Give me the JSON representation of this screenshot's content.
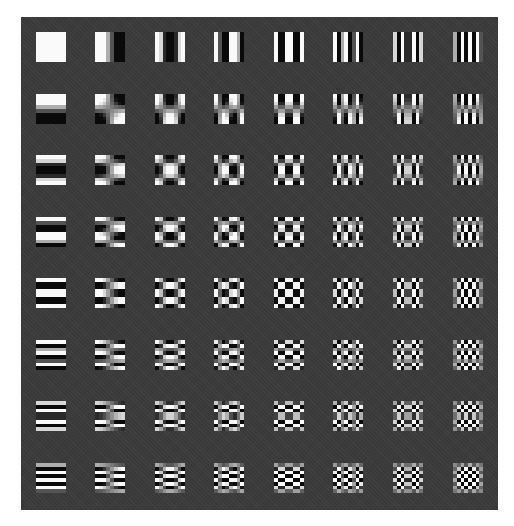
{
  "figure": {
    "title": "",
    "grid": {
      "rows": 8,
      "cols": 8
    },
    "panel_color": "#3b3b3b",
    "cell_size_px": 30,
    "col_x": [
      36,
      95,
      155,
      214,
      274,
      333,
      393,
      453
    ],
    "row_y": [
      32,
      94,
      155,
      217,
      278,
      340,
      401,
      463
    ],
    "basis": "cos((2x+1)u*pi/16) * cos((2y+1)v*pi/16)",
    "cells": [
      {
        "row": 0,
        "col": 0,
        "u": 0,
        "v": 0
      },
      {
        "row": 0,
        "col": 1,
        "u": 1,
        "v": 0
      },
      {
        "row": 0,
        "col": 2,
        "u": 2,
        "v": 0
      },
      {
        "row": 0,
        "col": 3,
        "u": 3,
        "v": 0
      },
      {
        "row": 0,
        "col": 4,
        "u": 4,
        "v": 0
      },
      {
        "row": 0,
        "col": 5,
        "u": 5,
        "v": 0
      },
      {
        "row": 0,
        "col": 6,
        "u": 6,
        "v": 0
      },
      {
        "row": 0,
        "col": 7,
        "u": 7,
        "v": 0
      },
      {
        "row": 1,
        "col": 0,
        "u": 0,
        "v": 1
      },
      {
        "row": 1,
        "col": 1,
        "u": 1,
        "v": 1
      },
      {
        "row": 1,
        "col": 2,
        "u": 2,
        "v": 1
      },
      {
        "row": 1,
        "col": 3,
        "u": 3,
        "v": 1
      },
      {
        "row": 1,
        "col": 4,
        "u": 4,
        "v": 1
      },
      {
        "row": 1,
        "col": 5,
        "u": 5,
        "v": 1
      },
      {
        "row": 1,
        "col": 6,
        "u": 6,
        "v": 1
      },
      {
        "row": 1,
        "col": 7,
        "u": 7,
        "v": 1
      },
      {
        "row": 2,
        "col": 0,
        "u": 0,
        "v": 2
      },
      {
        "row": 2,
        "col": 1,
        "u": 1,
        "v": 2
      },
      {
        "row": 2,
        "col": 2,
        "u": 2,
        "v": 2
      },
      {
        "row": 2,
        "col": 3,
        "u": 3,
        "v": 2
      },
      {
        "row": 2,
        "col": 4,
        "u": 4,
        "v": 2
      },
      {
        "row": 2,
        "col": 5,
        "u": 5,
        "v": 2
      },
      {
        "row": 2,
        "col": 6,
        "u": 6,
        "v": 2
      },
      {
        "row": 2,
        "col": 7,
        "u": 7,
        "v": 2
      },
      {
        "row": 3,
        "col": 0,
        "u": 0,
        "v": 3
      },
      {
        "row": 3,
        "col": 1,
        "u": 1,
        "v": 3
      },
      {
        "row": 3,
        "col": 2,
        "u": 2,
        "v": 3
      },
      {
        "row": 3,
        "col": 3,
        "u": 3,
        "v": 3
      },
      {
        "row": 3,
        "col": 4,
        "u": 4,
        "v": 3
      },
      {
        "row": 3,
        "col": 5,
        "u": 5,
        "v": 3
      },
      {
        "row": 3,
        "col": 6,
        "u": 6,
        "v": 3
      },
      {
        "row": 3,
        "col": 7,
        "u": 7,
        "v": 3
      },
      {
        "row": 4,
        "col": 0,
        "u": 0,
        "v": 4
      },
      {
        "row": 4,
        "col": 1,
        "u": 1,
        "v": 4
      },
      {
        "row": 4,
        "col": 2,
        "u": 2,
        "v": 4
      },
      {
        "row": 4,
        "col": 3,
        "u": 3,
        "v": 4
      },
      {
        "row": 4,
        "col": 4,
        "u": 4,
        "v": 4
      },
      {
        "row": 4,
        "col": 5,
        "u": 5,
        "v": 4
      },
      {
        "row": 4,
        "col": 6,
        "u": 6,
        "v": 4
      },
      {
        "row": 4,
        "col": 7,
        "u": 7,
        "v": 4
      },
      {
        "row": 5,
        "col": 0,
        "u": 0,
        "v": 5
      },
      {
        "row": 5,
        "col": 1,
        "u": 1,
        "v": 5
      },
      {
        "row": 5,
        "col": 2,
        "u": 2,
        "v": 5
      },
      {
        "row": 5,
        "col": 3,
        "u": 3,
        "v": 5
      },
      {
        "row": 5,
        "col": 4,
        "u": 4,
        "v": 5
      },
      {
        "row": 5,
        "col": 5,
        "u": 5,
        "v": 5
      },
      {
        "row": 5,
        "col": 6,
        "u": 6,
        "v": 5
      },
      {
        "row": 5,
        "col": 7,
        "u": 7,
        "v": 5
      },
      {
        "row": 6,
        "col": 0,
        "u": 0,
        "v": 6
      },
      {
        "row": 6,
        "col": 1,
        "u": 1,
        "v": 6
      },
      {
        "row": 6,
        "col": 2,
        "u": 2,
        "v": 6
      },
      {
        "row": 6,
        "col": 3,
        "u": 3,
        "v": 6
      },
      {
        "row": 6,
        "col": 4,
        "u": 4,
        "v": 6
      },
      {
        "row": 6,
        "col": 5,
        "u": 5,
        "v": 6
      },
      {
        "row": 6,
        "col": 6,
        "u": 6,
        "v": 6
      },
      {
        "row": 6,
        "col": 7,
        "u": 7,
        "v": 6
      },
      {
        "row": 7,
        "col": 0,
        "u": 0,
        "v": 7
      },
      {
        "row": 7,
        "col": 1,
        "u": 1,
        "v": 7
      },
      {
        "row": 7,
        "col": 2,
        "u": 2,
        "v": 7
      },
      {
        "row": 7,
        "col": 3,
        "u": 3,
        "v": 7
      },
      {
        "row": 7,
        "col": 4,
        "u": 4,
        "v": 7
      },
      {
        "row": 7,
        "col": 5,
        "u": 5,
        "v": 7
      },
      {
        "row": 7,
        "col": 6,
        "u": 6,
        "v": 7
      },
      {
        "row": 7,
        "col": 7,
        "u": 7,
        "v": 7
      }
    ]
  }
}
